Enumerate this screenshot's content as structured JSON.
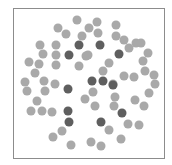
{
  "diagram": {
    "type": "dot-pattern",
    "radius": 4.5,
    "colors": {
      "light": "#a9a9a9",
      "dark": "#5f5f5f",
      "border": "#8c8c8c"
    },
    "frame": {
      "x": 13,
      "y": 8,
      "width": 152,
      "height": 151
    },
    "dark_dots": [
      [
        79,
        45
      ],
      [
        100,
        45
      ],
      [
        69,
        55
      ],
      [
        119,
        54
      ],
      [
        92,
        81
      ],
      [
        103,
        81
      ],
      [
        113,
        85
      ],
      [
        68,
        89
      ],
      [
        68,
        111
      ],
      [
        69,
        122
      ],
      [
        101,
        122
      ],
      [
        122,
        113
      ]
    ],
    "light_dots": [
      [
        77,
        20
      ],
      [
        97,
        22
      ],
      [
        116,
        25
      ],
      [
        58,
        28
      ],
      [
        89,
        28
      ],
      [
        66,
        34
      ],
      [
        82,
        36
      ],
      [
        98,
        33
      ],
      [
        116,
        36
      ],
      [
        124,
        40
      ],
      [
        136,
        43
      ],
      [
        141,
        43
      ],
      [
        129,
        48
      ],
      [
        148,
        53
      ],
      [
        143,
        61
      ],
      [
        145,
        71
      ],
      [
        154,
        75
      ],
      [
        155,
        84
      ],
      [
        124,
        76
      ],
      [
        134,
        77
      ],
      [
        149,
        93
      ],
      [
        135,
        100
      ],
      [
        144,
        106
      ],
      [
        40,
        45
      ],
      [
        56,
        45
      ],
      [
        43,
        54
      ],
      [
        56,
        55
      ],
      [
        29,
        62
      ],
      [
        39,
        64
      ],
      [
        56,
        65
      ],
      [
        35,
        73
      ],
      [
        79,
        66
      ],
      [
        88,
        55
      ],
      [
        25,
        82
      ],
      [
        44,
        81
      ],
      [
        55,
        84
      ],
      [
        27,
        91
      ],
      [
        45,
        91
      ],
      [
        37,
        101
      ],
      [
        31,
        111
      ],
      [
        42,
        111
      ],
      [
        52,
        112
      ],
      [
        86,
        56
      ],
      [
        109,
        63
      ],
      [
        103,
        71
      ],
      [
        113,
        84
      ],
      [
        93,
        92
      ],
      [
        85,
        99
      ],
      [
        115,
        97
      ],
      [
        95,
        106
      ],
      [
        114,
        106
      ],
      [
        62,
        131
      ],
      [
        53,
        137
      ],
      [
        71,
        145
      ],
      [
        91,
        142
      ],
      [
        101,
        146
      ],
      [
        109,
        130
      ],
      [
        121,
        139
      ],
      [
        128,
        124
      ],
      [
        139,
        125
      ]
    ]
  }
}
